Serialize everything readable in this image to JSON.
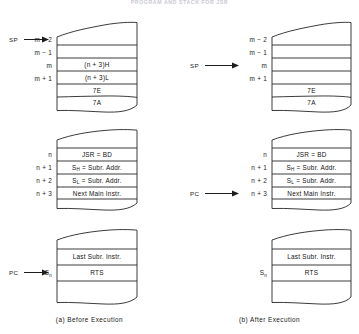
{
  "figure": {
    "page_title": "PROGRAM AND STACK FOR JSR",
    "caption_left": "(a) Before Execution",
    "caption_right": "(b) After Execution"
  },
  "colors": {
    "ink": "#1a1a1a",
    "rule": "#2b2b2b",
    "paper": "#ffffff",
    "title_faint": "#c9c9cf"
  },
  "before": {
    "name": "Before Execution",
    "stack_block": {
      "rows": [
        {
          "addr": "",
          "value": "",
          "pointer": ""
        },
        {
          "addr": "m − 2",
          "value": "",
          "pointer": "SP"
        },
        {
          "addr": "m − 1",
          "value": "(n + 3)H",
          "pointer": ""
        },
        {
          "addr": "m",
          "value": "(n + 3)L",
          "pointer": ""
        },
        {
          "addr": "m + 1",
          "value": "7E",
          "pointer": ""
        },
        {
          "addr": "",
          "value": "7A",
          "pointer": ""
        }
      ]
    },
    "program_block": {
      "rows": [
        {
          "addr": "",
          "value": "",
          "pointer": ""
        },
        {
          "addr": "n",
          "value": "JSR = BD",
          "pointer": ""
        },
        {
          "addr": "n + 1",
          "value": "SH = Subr. Addr.",
          "pointer": ""
        },
        {
          "addr": "n + 2",
          "value": "SL = Subr. Addr.",
          "pointer": ""
        },
        {
          "addr": "n + 3",
          "value": "Next Main Instr.",
          "pointer": ""
        },
        {
          "addr": "",
          "value": "",
          "pointer": ""
        }
      ]
    },
    "subroutine_block": {
      "rows": [
        {
          "addr": "",
          "value": "",
          "pointer": ""
        },
        {
          "addr": "",
          "value": "Last Subr. Instr.",
          "pointer": ""
        },
        {
          "addr": "Sn",
          "value": "RTS",
          "pointer": "PC"
        },
        {
          "addr": "",
          "value": "",
          "pointer": ""
        }
      ]
    }
  },
  "after": {
    "name": "After Execution",
    "stack_block": {
      "rows": [
        {
          "addr": "",
          "value": "",
          "pointer": ""
        },
        {
          "addr": "m − 2",
          "value": "",
          "pointer": ""
        },
        {
          "addr": "m − 1",
          "value": "",
          "pointer": ""
        },
        {
          "addr": "m",
          "value": "",
          "pointer": "SP"
        },
        {
          "addr": "m + 1",
          "value": "7E",
          "pointer": ""
        },
        {
          "addr": "",
          "value": "7A",
          "pointer": ""
        }
      ]
    },
    "program_block": {
      "rows": [
        {
          "addr": "",
          "value": "",
          "pointer": ""
        },
        {
          "addr": "n",
          "value": "JSR = BD",
          "pointer": ""
        },
        {
          "addr": "n + 1",
          "value": "SH = Subr. Addr.",
          "pointer": ""
        },
        {
          "addr": "n + 2",
          "value": "SL = Subr. Addr.",
          "pointer": ""
        },
        {
          "addr": "n + 3",
          "value": "Next Main Instr.",
          "pointer": "PC"
        },
        {
          "addr": "",
          "value": "",
          "pointer": ""
        }
      ]
    },
    "subroutine_block": {
      "rows": [
        {
          "addr": "",
          "value": "",
          "pointer": ""
        },
        {
          "addr": "",
          "value": "Last Subr. Instr.",
          "pointer": ""
        },
        {
          "addr": "Sn",
          "value": "RTS",
          "pointer": ""
        },
        {
          "addr": "",
          "value": "",
          "pointer": ""
        }
      ]
    }
  }
}
